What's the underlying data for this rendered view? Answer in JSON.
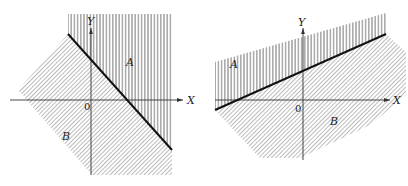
{
  "figures": [
    {
      "id": "left",
      "labels": {
        "y_axis": "Y",
        "x_axis": "X",
        "origin": "0",
        "region_a": "A",
        "region_b": "B"
      },
      "description": "Line with negative slope; region A above (vertical hatching), region B below (diagonal hatching)"
    },
    {
      "id": "right",
      "labels": {
        "y_axis": "Y",
        "x_axis": "X",
        "origin": "0",
        "region_a": "A",
        "region_b": "B"
      },
      "description": "Line with positive slope; region A above (vertical hatching), region B below (diagonal hatching)"
    }
  ],
  "colors": {
    "ink": "#222222",
    "hatch": "#555555",
    "background": "#ffffff"
  }
}
